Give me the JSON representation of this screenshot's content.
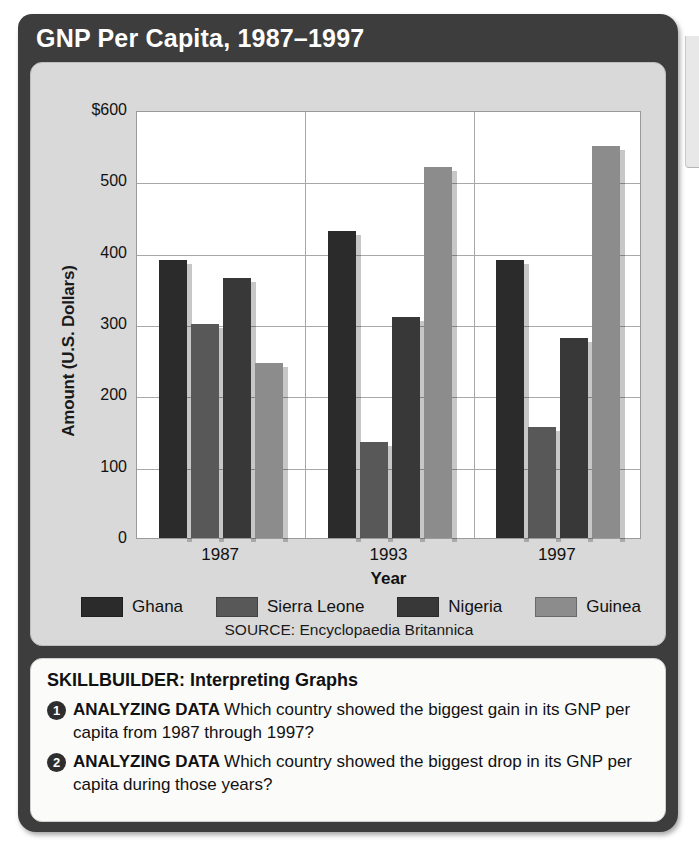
{
  "title": "GNP Per Capita, 1987–1997",
  "source": "SOURCE: Encyclopaedia Britannica",
  "chart_data": {
    "type": "bar",
    "title": "GNP Per Capita, 1987–1997",
    "xlabel": "Year",
    "ylabel": "Amount (U.S. Dollars)",
    "categories": [
      "1987",
      "1993",
      "1997"
    ],
    "ylim": [
      0,
      600
    ],
    "yticks": [
      "0",
      "100",
      "200",
      "300",
      "400",
      "500",
      "$600"
    ],
    "ytick_values": [
      0,
      100,
      200,
      300,
      400,
      500,
      600
    ],
    "grid": true,
    "legend_position": "bottom",
    "series": [
      {
        "name": "Ghana",
        "color": "#2b2b2b",
        "values": [
          390,
          430,
          390
        ]
      },
      {
        "name": "Sierra Leone",
        "color": "#585858",
        "values": [
          300,
          135,
          155
        ]
      },
      {
        "name": "Nigeria",
        "color": "#383838",
        "values": [
          365,
          310,
          280
        ]
      },
      {
        "name": "Guinea",
        "color": "#8c8c8c",
        "values": [
          245,
          520,
          550
        ]
      }
    ]
  },
  "skillbuilder": {
    "heading": "SKILLBUILDER: Interpreting Graphs",
    "questions": [
      {
        "number": "1",
        "lead": "ANALYZING DATA",
        "text": "Which country showed the biggest gain in its GNP per capita from 1987 through 1997?"
      },
      {
        "number": "2",
        "lead": "ANALYZING DATA",
        "text": "Which country showed the biggest drop in its GNP per capita during those years?"
      }
    ]
  }
}
